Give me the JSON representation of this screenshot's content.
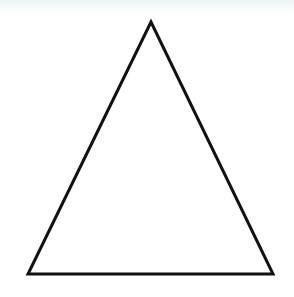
{
  "diagram": {
    "shape": "triangle",
    "type": "isosceles",
    "vertices": {
      "apex": [
        151,
        22
      ],
      "bottom_left": [
        28,
        274
      ],
      "bottom_right": [
        273,
        274
      ]
    },
    "stroke_color": "#111111",
    "stroke_width": 3,
    "fill_color": "#ffffff",
    "background_color": "#ffffff"
  }
}
